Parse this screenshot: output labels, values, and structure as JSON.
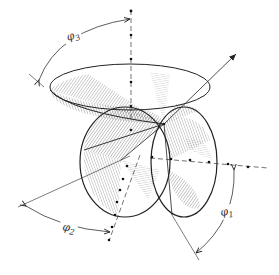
{
  "diagram": {
    "type": "euler-angles-geometry",
    "labels": {
      "phi3": {
        "symbol": "φ",
        "subscript": "3"
      },
      "phi2": {
        "symbol": "φ",
        "subscript": "2"
      },
      "phi1": {
        "symbol": "φ",
        "subscript": "1"
      }
    },
    "colors": {
      "line": "#222222",
      "hatch": "#555555",
      "background": "#ffffff"
    }
  }
}
